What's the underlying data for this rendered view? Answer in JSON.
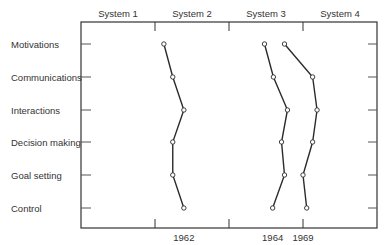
{
  "chart_data": {
    "type": "line",
    "orientation": "horizontal-profile",
    "title": "",
    "xlabel": "",
    "ylabel": "",
    "systems": [
      "System 1",
      "System 2",
      "System 3",
      "System 4"
    ],
    "categories": [
      "Motivations",
      "Communications",
      "Interactions",
      "Decision making",
      "Goal setting",
      "Control"
    ],
    "xlim": [
      0,
      4
    ],
    "grid": false,
    "legend": "series labels placed below axis",
    "series": [
      {
        "name": "1962",
        "values": [
          1.12,
          1.24,
          1.39,
          1.24,
          1.24,
          1.39
        ]
      },
      {
        "name": "1964",
        "values": [
          2.48,
          2.6,
          2.79,
          2.71,
          2.75,
          2.59
        ]
      },
      {
        "name": "1969",
        "values": [
          2.75,
          3.13,
          3.19,
          3.13,
          3.0,
          3.05
        ]
      }
    ],
    "series_label_positions": {
      "1962": 1.39,
      "1964": 2.59,
      "1969": 3.0
    }
  },
  "colors": {
    "line": "#2a2a2a",
    "frame": "#333333",
    "marker_fill": "#ffffff"
  }
}
